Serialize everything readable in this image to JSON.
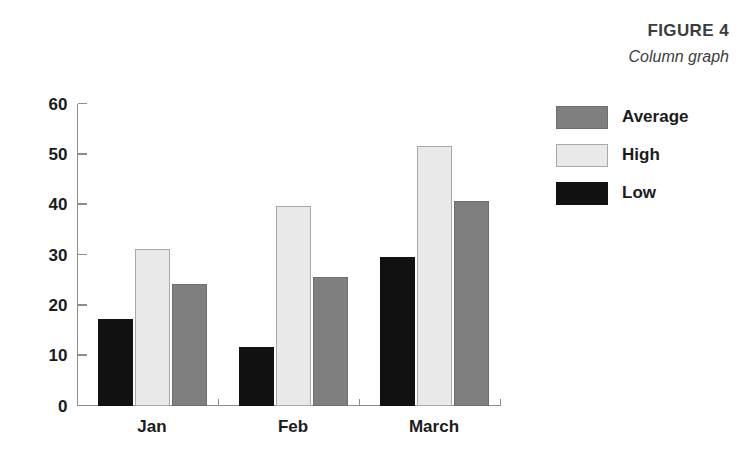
{
  "figure": {
    "number_label": "FIGURE 4",
    "subtitle": "Column graph"
  },
  "colors": {
    "low": "#111111",
    "high": "#e9e9e9",
    "high_border": "#a8a8a8",
    "average": "#7f7f7f",
    "average_border": "#6e6e6e",
    "axis": "#8c8c8c",
    "text": "#1b1b1b",
    "caption_text": "#3d3d3d",
    "background": "#ffffff"
  },
  "legend": {
    "position": "right",
    "items": [
      {
        "label": "Average",
        "swatch": "average"
      },
      {
        "label": "High",
        "swatch": "high"
      },
      {
        "label": "Low",
        "swatch": "low"
      }
    ]
  },
  "chart_data": {
    "type": "bar",
    "title": "FIGURE 4",
    "subtitle": "Column graph",
    "xlabel": "",
    "ylabel": "",
    "categories": [
      "Jan",
      "Feb",
      "March"
    ],
    "ylim": [
      0,
      60
    ],
    "yticks": [
      0,
      10,
      20,
      30,
      40,
      50,
      60
    ],
    "ytick_labels": [
      "0",
      "10",
      "20",
      "30",
      "40",
      "50",
      "60"
    ],
    "grid": false,
    "legend_position": "right",
    "bar_order_in_group": [
      "Low",
      "High",
      "Average"
    ],
    "series": [
      {
        "name": "Average",
        "color": "#7f7f7f",
        "values": [
          24,
          25.5,
          40.5
        ]
      },
      {
        "name": "High",
        "color": "#e9e9e9",
        "values": [
          31,
          39.5,
          51.5
        ]
      },
      {
        "name": "Low",
        "color": "#111111",
        "values": [
          17,
          11.5,
          29.5
        ]
      }
    ]
  }
}
